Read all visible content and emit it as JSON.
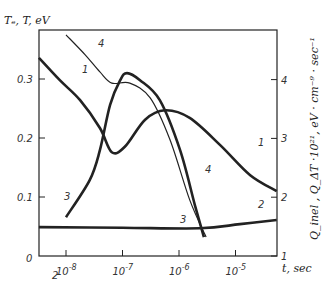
{
  "chart_data": {
    "type": "line",
    "title": "",
    "xlabel": "t, sec",
    "ylabel_left": "Te, T, eV",
    "ylabel_right": "Q_inel, Q_ΔT · 10^21, eV · cm^-9 · sec^-1",
    "x_scale": "log",
    "xlim_log10": [
      -8.48,
      -4.27
    ],
    "x_ticks": [
      {
        "log10": -8,
        "label": "10^-8"
      },
      {
        "log10": -7,
        "label": "10^-7"
      },
      {
        "log10": -6,
        "label": "10^-6"
      },
      {
        "log10": -5,
        "label": "10^-5"
      }
    ],
    "ylim_left": [
      0,
      0.38
    ],
    "y_ticks_left": [
      "0",
      "0.1",
      "0.2",
      "0.3"
    ],
    "ylim_right": [
      1,
      4.85
    ],
    "y_ticks_right": [
      "1",
      "2",
      "3",
      "4"
    ],
    "grid": false,
    "legend": "none (curves numbered 1-4 with leader lines)",
    "series": [
      {
        "name": "1",
        "axis": "left",
        "weight": "thick",
        "log10_t": [
          -8.48,
          -8.11,
          -7.75,
          -7.4,
          -7.19,
          -6.96,
          -6.6,
          -6.25,
          -5.81,
          -5.27,
          -4.74,
          -4.27
        ],
        "values": [
          0.336,
          0.298,
          0.264,
          0.217,
          0.176,
          0.185,
          0.231,
          0.247,
          0.234,
          0.188,
          0.137,
          0.11
        ]
      },
      {
        "name": "2",
        "axis": "left",
        "weight": "thick",
        "log10_t": [
          -8.48,
          -7.0,
          -5.63,
          -4.92,
          -4.27
        ],
        "values": [
          0.049,
          0.048,
          0.047,
          0.054,
          0.061
        ]
      },
      {
        "name": "3",
        "axis": "right",
        "weight": "thick",
        "log10_t": [
          -8.0,
          -7.58,
          -7.4,
          -7.22,
          -7.04,
          -6.92,
          -6.69,
          -6.34,
          -5.98,
          -5.72,
          -5.56
        ],
        "values": [
          1.66,
          2.29,
          2.8,
          3.57,
          3.99,
          4.11,
          3.99,
          3.65,
          2.8,
          1.87,
          1.32
        ]
      },
      {
        "name": "4",
        "axis": "left",
        "weight": "thin",
        "log10_t": [
          -8.0,
          -7.66,
          -7.4,
          -7.19,
          -6.87,
          -6.51,
          -6.16,
          -5.81,
          -5.52
        ],
        "values": [
          0.375,
          0.341,
          0.312,
          0.293,
          0.293,
          0.268,
          0.197,
          0.095,
          0.032
        ]
      }
    ],
    "annotations": [
      {
        "text": "1",
        "x": 82,
        "y": 73
      },
      {
        "text": "1",
        "x": 258,
        "y": 146
      },
      {
        "text": "2",
        "x": 52,
        "y": 279
      },
      {
        "text": "2",
        "x": 258,
        "y": 208
      },
      {
        "text": "3",
        "x": 64,
        "y": 200
      },
      {
        "text": "3",
        "x": 180,
        "y": 223
      },
      {
        "text": "4",
        "x": 98,
        "y": 47
      },
      {
        "text": "4",
        "x": 205,
        "y": 173
      }
    ]
  },
  "axis_labels": {
    "left": "Tₑ, T, eV",
    "bottom": "t, sec",
    "right": "Q_inel , Q_ΔT ·10²¹, eV · cm⁻⁹ · sec⁻¹",
    "origin": "0"
  }
}
